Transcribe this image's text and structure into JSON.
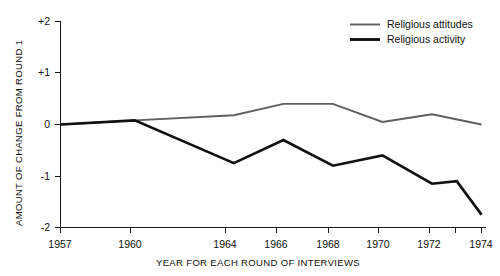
{
  "chart_data": {
    "type": "line",
    "title": "",
    "xlabel": "YEAR FOR EACH ROUND OF INTERVIEWS",
    "ylabel": "AMOUNT OF CHANGE FROM ROUND 1",
    "x": [
      1957,
      1960,
      1964,
      1966,
      1968,
      1970,
      1972,
      1973,
      1974
    ],
    "xlim": [
      1957,
      1974
    ],
    "ylim": [
      -2,
      2
    ],
    "grid": false,
    "legend_position": "top-right",
    "x_tick_labels": [
      "1957",
      "1960",
      "1964",
      "1966",
      "1968",
      "1970",
      "1972",
      "1974"
    ],
    "x_tick_values": [
      1957,
      1960,
      1964,
      1966,
      1968,
      1970,
      1972,
      1974
    ],
    "x_minor_tick_values": [
      1973
    ],
    "y_tick_labels": [
      "+2",
      "+1",
      "0",
      "-1",
      "-2"
    ],
    "y_tick_values": [
      2,
      1,
      0,
      -1,
      -2
    ],
    "series": [
      {
        "name": "Religious attitudes",
        "color": "#5f5f5f",
        "x": [
          1957,
          1960,
          1964,
          1966,
          1968,
          1970,
          1972,
          1974
        ],
        "values": [
          0.0,
          0.08,
          0.18,
          0.4,
          0.4,
          0.05,
          0.2,
          0.0
        ]
      },
      {
        "name": "Religious activity",
        "color": "#111111",
        "x": [
          1957,
          1960,
          1964,
          1966,
          1968,
          1970,
          1972,
          1973,
          1974
        ],
        "values": [
          0.0,
          0.08,
          -0.75,
          -0.3,
          -0.8,
          -0.6,
          -1.15,
          -1.1,
          -1.75
        ]
      }
    ]
  },
  "legend": {
    "items": [
      {
        "label": "Religious attitudes"
      },
      {
        "label": "Religious activity"
      }
    ]
  },
  "axes": {
    "y_title": "AMOUNT OF CHANGE FROM ROUND 1",
    "x_title": "YEAR FOR EACH ROUND OF INTERVIEWS",
    "y_ticks": [
      {
        "label": "+2"
      },
      {
        "label": "+1"
      },
      {
        "label": "0"
      },
      {
        "label": "-1"
      },
      {
        "label": "-2"
      }
    ],
    "x_ticks": [
      {
        "label": "1957"
      },
      {
        "label": "1960"
      },
      {
        "label": "1964"
      },
      {
        "label": "1966"
      },
      {
        "label": "1968"
      },
      {
        "label": "1970"
      },
      {
        "label": "1972"
      },
      {
        "label": "1974"
      }
    ]
  }
}
